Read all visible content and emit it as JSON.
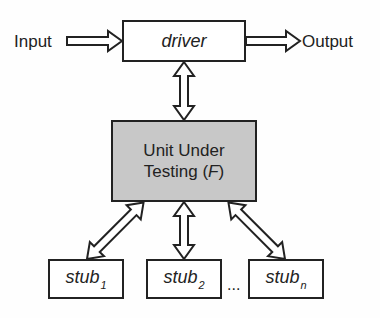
{
  "diagram": {
    "input_label": "Input",
    "output_label": "Output",
    "driver": {
      "label": "driver"
    },
    "uut": {
      "line1": "Unit Under",
      "line2_prefix": "Testing (",
      "line2_var": "F",
      "line2_suffix": ")"
    },
    "stubs": [
      {
        "base": "stub",
        "sub": "1"
      },
      {
        "base": "stub",
        "sub": "2"
      },
      {
        "base": "stub",
        "sub": "n"
      }
    ],
    "ellipsis": "...",
    "colors": {
      "uut_fill": "#c8c8c8",
      "stroke": "#222222",
      "box_fill": "#ffffff"
    }
  }
}
